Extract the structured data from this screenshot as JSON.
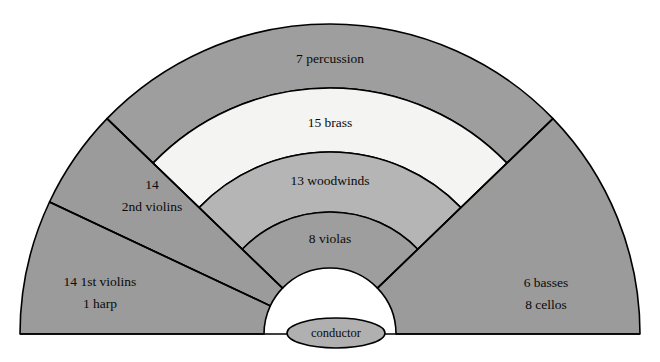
{
  "colors": {
    "background": "#ffffff",
    "outline": "#000000",
    "strings_gray": "#9b9b9b",
    "percussion_gray": "#9e9e9e",
    "brass_white": "#f4f4f2",
    "woodwinds_gray": "#b5b5b5",
    "violas_gray": "#9e9e9e",
    "conductor_gray": "#b0b0b0",
    "text": "#0a0a0a"
  },
  "geometry": {
    "center_x": 330,
    "center_y": 334,
    "outer_radius": 310,
    "inner_radius": 66,
    "band_radii": [
      310,
      246,
      182,
      122,
      66
    ]
  },
  "sections": [
    {
      "id": "percussion",
      "name": "percussion",
      "count": 7,
      "label": "7 percussion",
      "lines": [
        "7 percussion"
      ],
      "fill": "#9e9e9e",
      "label_x": 330,
      "label_y": 60
    },
    {
      "id": "brass",
      "name": "brass",
      "count": 15,
      "label": "15 brass",
      "lines": [
        "15 brass"
      ],
      "fill": "#f4f4f2",
      "label_x": 330,
      "label_y": 124
    },
    {
      "id": "woodwinds",
      "name": "woodwinds",
      "count": 13,
      "label": "13 woodwinds",
      "lines": [
        "13 woodwinds"
      ],
      "fill": "#b5b5b5",
      "label_x": 330,
      "label_y": 182
    },
    {
      "id": "violas",
      "name": "violas",
      "count": 8,
      "label": "8 violas",
      "lines": [
        "8 violas"
      ],
      "fill": "#9e9e9e",
      "label_x": 330,
      "label_y": 240
    },
    {
      "id": "second-violins",
      "name": "2nd violins",
      "count": 14,
      "label": "14 2nd violins",
      "lines": [
        "14",
        "2nd violins"
      ],
      "fill": "#9b9b9b",
      "label_x": 152,
      "label_y": 192
    },
    {
      "id": "first-violins-harp",
      "name": "1st violins and harp",
      "count": 15,
      "label": "14 1st violins 1 harp",
      "lines": [
        "14 1st violins",
        "1 harp"
      ],
      "fill": "#9b9b9b",
      "label_x": 100,
      "label_y": 283
    },
    {
      "id": "basses-cellos",
      "name": "basses and cellos",
      "count": 14,
      "label": "6 basses 8 cellos",
      "lines": [
        "6 basses",
        "8 cellos"
      ],
      "fill": "#9b9b9b",
      "label_x": 546,
      "label_y": 284
    }
  ],
  "conductor": {
    "label": "conductor",
    "fill": "#b0b0b0",
    "cx": 336,
    "cy": 333,
    "rx": 49,
    "ry": 15
  }
}
